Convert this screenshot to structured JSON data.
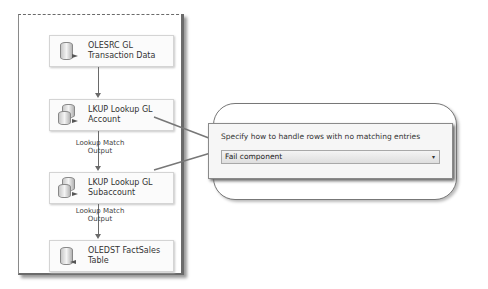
{
  "canvas": {
    "nodes": [
      {
        "label_line1": "OLESRC GL",
        "label_line2": "Transaction Data",
        "icon": "database-source-icon"
      },
      {
        "label_line1": "LKUP Lookup GL",
        "label_line2": "Account",
        "icon": "lookup-icon"
      },
      {
        "label_line1": "LKUP Lookup GL",
        "label_line2": "Subaccount",
        "icon": "lookup-icon"
      },
      {
        "label_line1": "OLEDST FactSales",
        "label_line2": "Table",
        "icon": "database-destination-icon"
      }
    ],
    "paths": [
      {
        "label": ""
      },
      {
        "label": "Lookup Match Output"
      },
      {
        "label": "Lookup Match Output"
      }
    ]
  },
  "callout": {
    "prompt": "Specify how to handle rows with no matching entries",
    "select_value": "Fail component",
    "chevron": "▾"
  }
}
